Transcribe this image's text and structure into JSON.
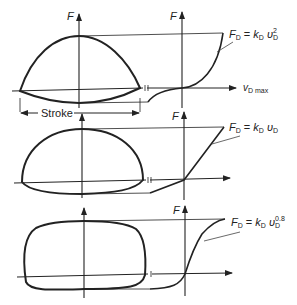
{
  "diagram": {
    "panels": [
      {
        "axis_label": "F",
        "right_axis_label": "F",
        "equation": {
          "lhs": "F",
          "lhs_sub": "D",
          "eq": "=",
          "k": "k",
          "k_sub": "D",
          "v": "υ",
          "v_sub": "D",
          "exponent": "2"
        },
        "x_axis_label": "v",
        "x_axis_sub": "D max",
        "stroke_label": "Stroke"
      },
      {
        "axis_label": "F",
        "right_axis_label": "F",
        "equation": {
          "lhs": "F",
          "lhs_sub": "D",
          "eq": "=",
          "k": "k",
          "k_sub": "D",
          "v": "υ",
          "v_sub": "D",
          "exponent": ""
        }
      },
      {
        "axis_label": "F",
        "right_axis_label": "F",
        "equation": {
          "lhs": "F",
          "lhs_sub": "D",
          "eq": "=",
          "k": "k",
          "k_sub": "D",
          "v": "υ",
          "v_sub": "D",
          "exponent": "0.8"
        }
      }
    ]
  },
  "colors": {
    "stroke": "#222222",
    "thin": "#444444",
    "background": "#ffffff"
  }
}
